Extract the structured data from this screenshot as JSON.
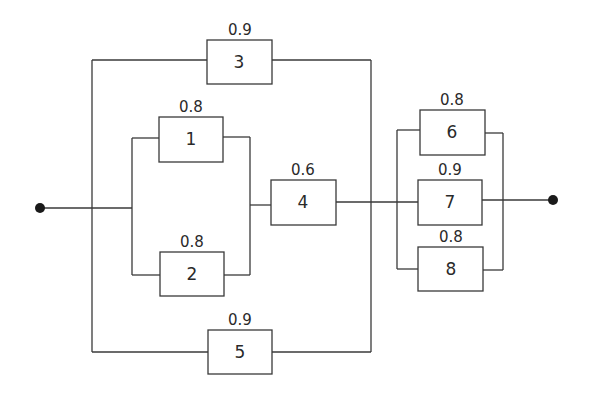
{
  "diagram": {
    "type": "reliability-block-diagram",
    "terminals": {
      "input": "input-node",
      "output": "output-node"
    },
    "blocks": [
      {
        "id": "1",
        "reliability": "0.8"
      },
      {
        "id": "2",
        "reliability": "0.8"
      },
      {
        "id": "3",
        "reliability": "0.9"
      },
      {
        "id": "4",
        "reliability": "0.6"
      },
      {
        "id": "5",
        "reliability": "0.9"
      },
      {
        "id": "6",
        "reliability": "0.8"
      },
      {
        "id": "7",
        "reliability": "0.9"
      },
      {
        "id": "8",
        "reliability": "0.8"
      }
    ],
    "structure": {
      "stage1": "parallel( 3, series( parallel(1,2), 4 ), 5 )",
      "stage2": "parallel( 6, 7, 8 )",
      "overall": "series( stage1, stage2 )"
    },
    "colors": {
      "line": "#3a3a3a",
      "text": "#2a2a2a",
      "background": "#ffffff"
    }
  }
}
